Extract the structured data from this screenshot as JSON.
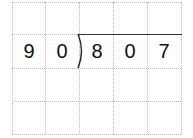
{
  "problem": {
    "type": "long-division",
    "divisor": [
      "9",
      "0"
    ],
    "dividend": [
      "8",
      "0",
      "7"
    ]
  },
  "grid": {
    "columns": 5,
    "rows": 4
  }
}
